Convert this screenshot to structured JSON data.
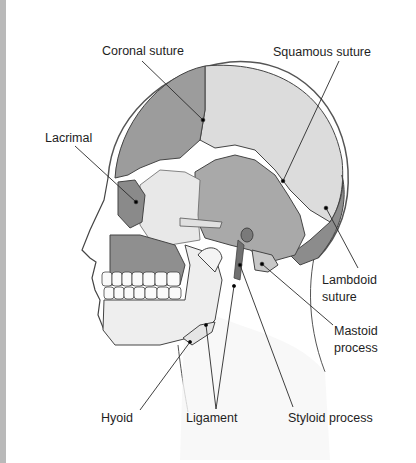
{
  "diagram": {
    "colors": {
      "frontal": "#9a9a9a",
      "parietal": "#d9d9d9",
      "temporal": "#a8a8a8",
      "zygomatic": "#e8e8e8",
      "maxilla": "#8f8f8f",
      "mandible": "#ededed",
      "occipital": "#8c8c8c",
      "outline": "#3a3a3a",
      "leader": "#2a2a2a",
      "text": "#1e1e1e"
    },
    "labels": {
      "coronal_suture": "Coronal suture",
      "squamous_suture": "Squamous suture",
      "lacrimal": "Lacrimal",
      "lambdoid_suture_1": "Lambdoid",
      "lambdoid_suture_2": "suture",
      "mastoid_process_1": "Mastoid",
      "mastoid_process_2": "process",
      "hyoid": "Hyoid",
      "ligament": "Ligament",
      "styloid_process": "Styloid process"
    }
  }
}
